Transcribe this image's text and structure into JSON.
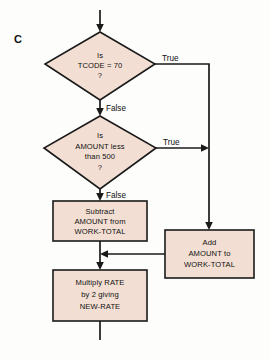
{
  "figure": {
    "panel_label": "C",
    "type": "flowchart",
    "background_color": "#fdfdfb",
    "node_fill_color": "#f3ded3",
    "line_color": "#1a1a1a"
  },
  "nodes": {
    "decision_tcode": {
      "shape": "diamond",
      "lines": [
        "Is",
        "TCODE = 70",
        "?"
      ]
    },
    "decision_amount": {
      "shape": "diamond",
      "lines": [
        "Is",
        "AMOUNT less",
        "than 500",
        "?"
      ]
    },
    "process_subtract": {
      "shape": "rectangle",
      "lines": [
        "Subtract",
        "AMOUNT from",
        "WORK-TOTAL"
      ]
    },
    "process_add": {
      "shape": "rectangle",
      "lines": [
        "Add",
        "AMOUNT to",
        "WORK-TOTAL"
      ]
    },
    "process_multiply": {
      "shape": "rectangle",
      "lines": [
        "Multiply RATE",
        "by 2 giving",
        "NEW-RATE"
      ]
    }
  },
  "edge_labels": {
    "tcode_true": "True",
    "tcode_false": "False",
    "amount_true": "True",
    "amount_false": "False"
  }
}
